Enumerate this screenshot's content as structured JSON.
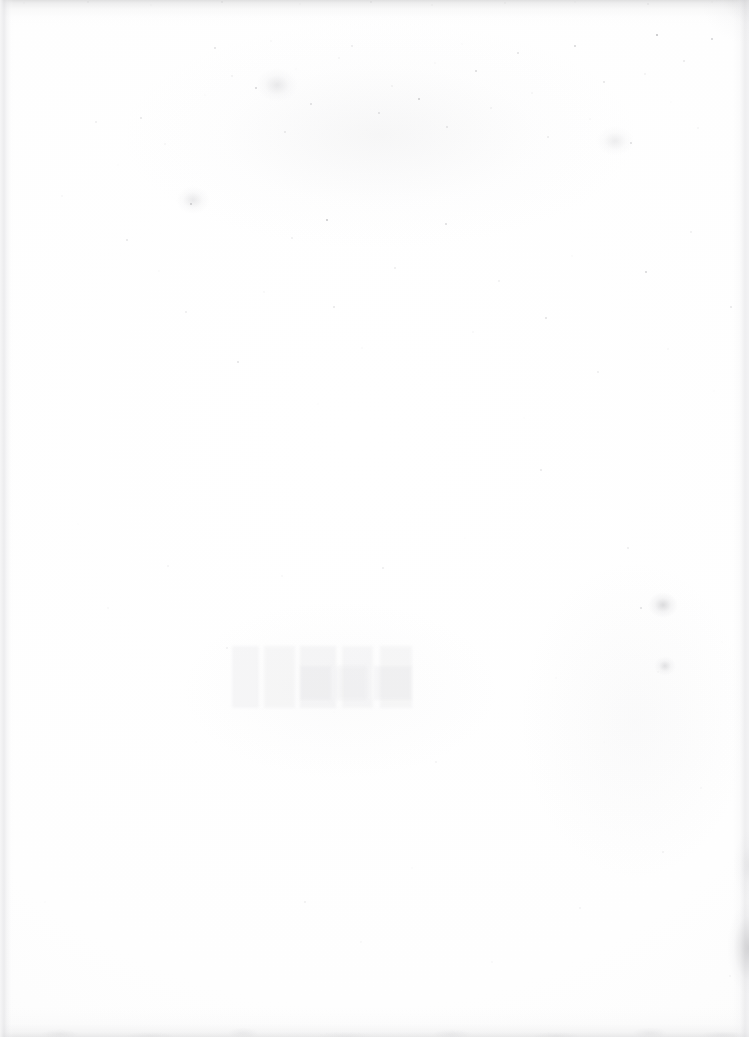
{
  "page": {
    "type": "blank-scanned-page",
    "width": 749,
    "height": 1037,
    "visible_text": "",
    "text_content_present": false,
    "paper_color": "#fdfdfd",
    "speckle_color": "#80808a",
    "edge_shadow_color": "#969698",
    "smudge_color": "#96969a"
  },
  "artifacts": {
    "edges": [
      {
        "name": "top-scan-edge",
        "position": "top",
        "thickness_px": 26,
        "tone": "#969698"
      },
      {
        "name": "bottom-scan-edge",
        "position": "bottom",
        "thickness_px": 30,
        "tone": "#a0a0a3"
      },
      {
        "name": "left-scan-edge",
        "position": "left",
        "thickness_px": 14,
        "tone": "#dedee1"
      },
      {
        "name": "right-scan-edge",
        "position": "right",
        "thickness_px": 16,
        "tone": "#e0e0e3"
      }
    ],
    "smudges": [
      {
        "name": "right-margin-smudge",
        "x": 715,
        "y": 930,
        "tone": "#96969a"
      },
      {
        "name": "top-right-corner-shade",
        "x": 720,
        "y": 18,
        "tone": "#bababe"
      }
    ],
    "foxing_clusters": [
      {
        "name": "cluster-right-lower",
        "x": 663,
        "y": 605
      },
      {
        "name": "cluster-right-lower-2",
        "x": 665,
        "y": 666
      },
      {
        "name": "cluster-upper-center",
        "x": 277,
        "y": 85
      },
      {
        "name": "cluster-upper-left",
        "x": 193,
        "y": 200
      },
      {
        "name": "cluster-upper-right",
        "x": 615,
        "y": 141
      }
    ],
    "showthrough": {
      "name": "verso-text-ghost",
      "x": 232,
      "y": 646,
      "width": 190,
      "height": 62,
      "legible": false
    },
    "speckle_bands": [
      {
        "name": "dense-upper-third",
        "y_range": [
          30,
          230
        ],
        "density": "high"
      },
      {
        "name": "medium-upper-middle",
        "y_range": [
          120,
          430
        ],
        "density": "medium"
      },
      {
        "name": "sparse-lower-half",
        "y_range": [
          460,
          1000
        ],
        "density": "low"
      }
    ]
  }
}
